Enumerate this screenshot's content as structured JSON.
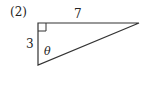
{
  "problem_label": "(2)",
  "triangle": {
    "top_side_label": "7",
    "left_side_label": "3",
    "angle_label": "θ",
    "right_angle_marker": true,
    "vertices": {
      "top_left": [
        38,
        23
      ],
      "top_right": [
        139,
        23
      ],
      "bottom_left": [
        38,
        65
      ]
    },
    "stroke_color": "#333333"
  }
}
